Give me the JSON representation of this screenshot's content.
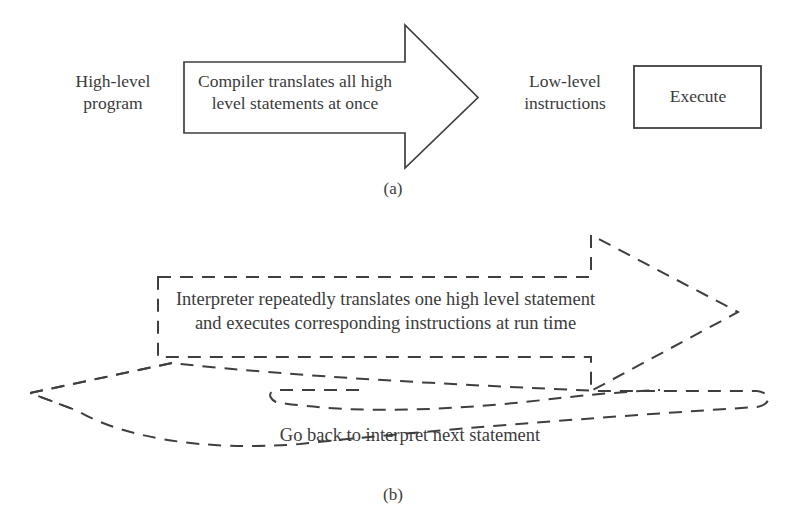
{
  "figure": {
    "line_color": "#3f3f3f",
    "background": "#ffffff",
    "panels": [
      {
        "caption": "(a)",
        "model": "compiler",
        "nodes": [
          {
            "name": "high-level-program",
            "text": "High-level\nprogram",
            "shape": "text"
          },
          {
            "name": "compiler-arrow",
            "text": "Compiler translates all high\nlevel statements at once",
            "shape": "block-arrow-solid"
          },
          {
            "name": "low-level-instructions",
            "text": "Low-level\ninstructions",
            "shape": "text"
          },
          {
            "name": "execute-box",
            "text": "Execute",
            "shape": "rectangle-solid"
          }
        ]
      },
      {
        "caption": "(b)",
        "model": "interpreter",
        "nodes": [
          {
            "name": "interpreter-arrow",
            "text": "Interpreter repeatedly translates one high level statement\nand executes corresponding instructions at run time",
            "shape": "block-arrow-dashed"
          },
          {
            "name": "go-back-loop",
            "text": "Go back to interpret next statement",
            "shape": "curved-block-arrow-dashed"
          }
        ]
      }
    ]
  },
  "panel_a": {
    "high_level_program": "High-level\nprogram",
    "compiler_text": "Compiler translates all high\nlevel statements at once",
    "low_level_instructions": "Low-level\ninstructions",
    "execute": "Execute",
    "caption": "(a)"
  },
  "panel_b": {
    "interpreter_text": "Interpreter repeatedly translates one high level statement\nand executes corresponding instructions at run time",
    "go_back_text": "Go back to interpret next statement",
    "caption": "(b)"
  }
}
